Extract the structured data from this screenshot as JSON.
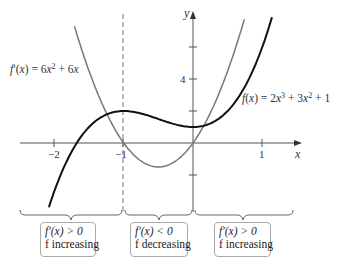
{
  "diagram": {
    "axes": {
      "x_label": "x",
      "y_label": "y",
      "x_ticks": [
        {
          "value": -2,
          "label": "−2"
        },
        {
          "value": -1,
          "label": "−1"
        },
        {
          "value": 1,
          "label": "1"
        }
      ],
      "y_ticks": [
        {
          "value": 4,
          "label": "4"
        }
      ]
    },
    "curves": {
      "f": {
        "label": "f(x) = 2x³ + 3x² + 1",
        "color": "#111111"
      },
      "fprime": {
        "label": "f′(x) = 6x² + 6x",
        "color": "#777777"
      }
    },
    "dashed_line": {
      "x": -1
    },
    "intervals": [
      {
        "line1": "f′(x) > 0",
        "line2": "f increasing"
      },
      {
        "line1": "f′(x) < 0",
        "line2": "f decreasing"
      },
      {
        "line1": "f′(x) > 0",
        "line2": "f increasing"
      }
    ]
  }
}
